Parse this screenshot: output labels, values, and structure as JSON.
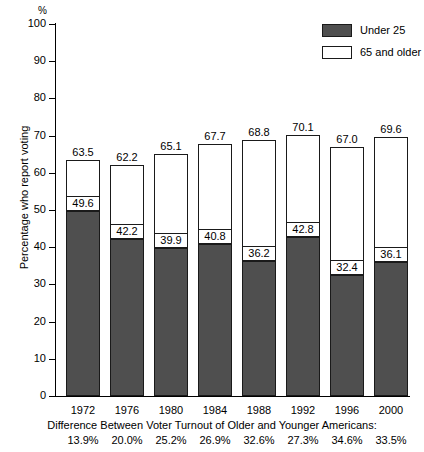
{
  "chart_data": {
    "type": "bar",
    "title": "",
    "subtitle": "",
    "xlabel": "",
    "ylabel": "Percentage who report voting",
    "y_unit_symbol": "%",
    "ylim": [
      0,
      100
    ],
    "ytick_values": [
      0,
      10,
      20,
      30,
      40,
      50,
      60,
      70,
      80,
      90,
      100
    ],
    "ytick_labels": [
      "0",
      "10",
      "20",
      "30",
      "40",
      "50",
      "60",
      "70",
      "80",
      "90",
      "100"
    ],
    "grid": false,
    "legend_position": "top-right",
    "stacked_overlay": true,
    "categories": [
      "1972",
      "1976",
      "1980",
      "1984",
      "1988",
      "1992",
      "1996",
      "2000"
    ],
    "series": [
      {
        "name": "65 and older",
        "style": "outline",
        "color": "#ffffff",
        "values": [
          63.5,
          62.2,
          65.1,
          67.7,
          68.8,
          70.1,
          67.0,
          69.6
        ]
      },
      {
        "name": "Under 25",
        "style": "filled",
        "color": "#4f4f4f",
        "values": [
          49.6,
          42.2,
          39.9,
          40.8,
          36.2,
          42.8,
          32.4,
          36.1
        ]
      }
    ],
    "annotations": {
      "caption": "Difference Between Voter Turnout of Older and Younger Americans:",
      "difference_values": [
        "13.9%",
        "20.0%",
        "25.2%",
        "26.9%",
        "32.6%",
        "27.3%",
        "34.6%",
        "33.5%"
      ]
    }
  },
  "legend": {
    "items": [
      {
        "label": "Under 25",
        "swatch": "filled"
      },
      {
        "label": "65 and older",
        "swatch": "hollow"
      }
    ]
  }
}
